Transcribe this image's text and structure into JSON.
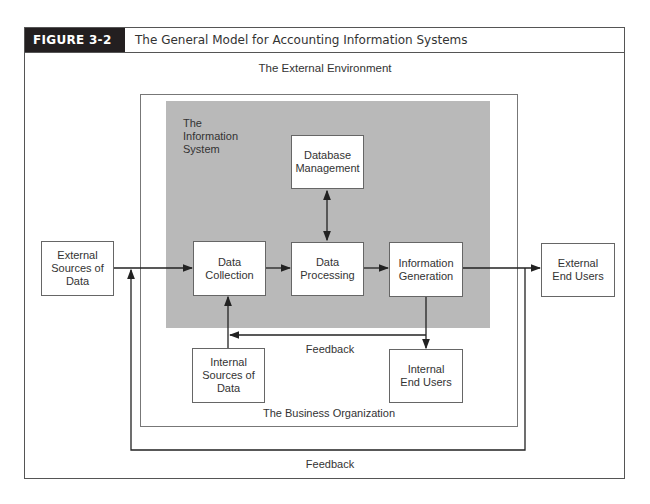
{
  "figure": {
    "number_label": "FIGURE 3-2",
    "title": "The General Model for Accounting Information Systems"
  },
  "regions": {
    "external_environment": "The External Environment",
    "business_organization": "The Business Organization",
    "information_system": "The Information System"
  },
  "nodes": {
    "external_sources": "External Sources of Data",
    "data_collection": "Data Collection",
    "database_management": "Database Management",
    "data_processing": "Data Processing",
    "information_generation": "Information Generation",
    "external_end_users": "External End Users",
    "internal_sources": "Internal Sources of Data",
    "internal_end_users": "Internal End Users"
  },
  "edges": [
    {
      "from": "External Sources of Data",
      "to": "Data Collection"
    },
    {
      "from": "Data Collection",
      "to": "Data Processing"
    },
    {
      "from": "Data Processing",
      "to": "Database Management",
      "bidirectional": true
    },
    {
      "from": "Data Processing",
      "to": "Information Generation"
    },
    {
      "from": "Information Generation",
      "to": "External End Users"
    },
    {
      "from": "Information Generation",
      "to": "Internal End Users"
    },
    {
      "from": "Internal Sources of Data",
      "to": "Data Collection"
    },
    {
      "from": "Internal End Users",
      "to": "Data Collection",
      "label": "Feedback"
    },
    {
      "from": "External End Users",
      "to": "Data Collection",
      "label": "Feedback"
    }
  ],
  "feedback": {
    "inner_label": "Feedback",
    "outer_label": "Feedback"
  },
  "colors": {
    "information_system_fill": "#b9b9b9",
    "figure_label_bg": "#231f20",
    "line": "#222222"
  }
}
